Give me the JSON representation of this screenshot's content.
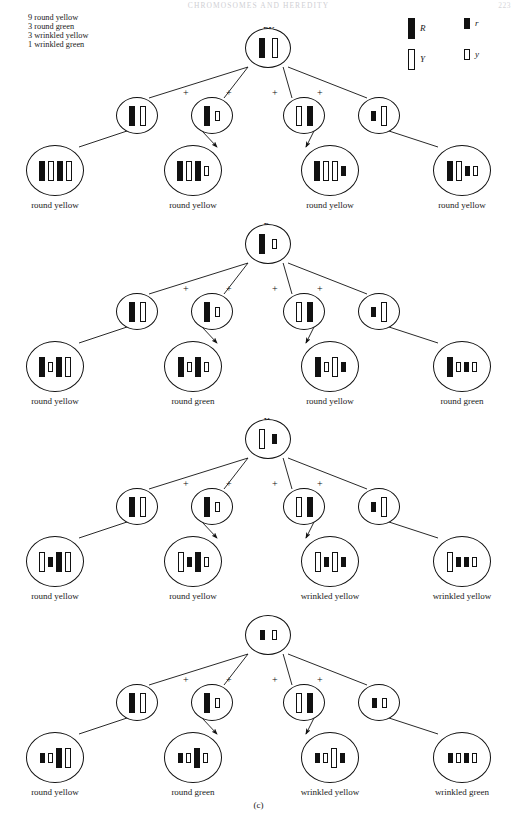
{
  "page": {
    "running_head": "CHROMOSOMES AND HEREDITY",
    "folio": "223",
    "panel_letter": "(c)"
  },
  "ratio_key": {
    "lines": [
      "9 round yellow",
      "3 round green",
      "3 wrinkled yellow",
      "1 wrinkled green"
    ]
  },
  "allele_legend": {
    "items": [
      {
        "symbol": "R",
        "type": "dark",
        "size": "tall",
        "name": "allele-R"
      },
      {
        "symbol": "r",
        "type": "dark",
        "size": "short",
        "name": "allele-r"
      },
      {
        "symbol": "Y",
        "type": "light",
        "size": "tall",
        "name": "allele-Y"
      },
      {
        "symbol": "y",
        "type": "light",
        "size": "short",
        "name": "allele-y"
      }
    ]
  },
  "gamete_types": {
    "labels": [
      "RY",
      "Ry",
      "Yr",
      "ry"
    ],
    "plus_symbol": "+"
  },
  "chart_data": {
    "type": "diagram",
    "phenotype_ratio": {
      "round yellow": 9,
      "round green": 3,
      "wrinkled yellow": 3,
      "wrinkled green": 1
    },
    "rows": [
      {
        "parent_label": "RY",
        "parent_bars": [
          {
            "type": "dark",
            "size": "tall"
          },
          {
            "type": "light",
            "size": "tall"
          }
        ],
        "gametes": [
          {
            "label": "RY",
            "bars": [
              {
                "type": "dark",
                "size": "tall"
              },
              {
                "type": "light",
                "size": "tall"
              }
            ]
          },
          {
            "label": "Ry",
            "bars": [
              {
                "type": "dark",
                "size": "tall"
              },
              {
                "type": "light",
                "size": "short"
              }
            ]
          },
          {
            "label": "Yr",
            "bars": [
              {
                "type": "light",
                "size": "tall"
              },
              {
                "type": "dark",
                "size": "tall"
              }
            ]
          },
          {
            "label": "ry",
            "bars": [
              {
                "type": "dark",
                "size": "short"
              },
              {
                "type": "light",
                "size": "tall"
              }
            ]
          }
        ],
        "offspring": [
          {
            "phenotype": "round yellow",
            "bars": [
              {
                "type": "dark",
                "size": "tall"
              },
              {
                "type": "light",
                "size": "tall"
              },
              {
                "type": "dark",
                "size": "tall"
              },
              {
                "type": "light",
                "size": "tall"
              }
            ]
          },
          {
            "phenotype": "round yellow",
            "bars": [
              {
                "type": "dark",
                "size": "tall"
              },
              {
                "type": "light",
                "size": "tall"
              },
              {
                "type": "dark",
                "size": "tall"
              },
              {
                "type": "light",
                "size": "short"
              }
            ]
          },
          {
            "phenotype": "round yellow",
            "bars": [
              {
                "type": "dark",
                "size": "tall"
              },
              {
                "type": "light",
                "size": "tall"
              },
              {
                "type": "light",
                "size": "tall"
              },
              {
                "type": "dark",
                "size": "short"
              }
            ]
          },
          {
            "phenotype": "round yellow",
            "bars": [
              {
                "type": "dark",
                "size": "tall"
              },
              {
                "type": "light",
                "size": "tall"
              },
              {
                "type": "dark",
                "size": "short"
              },
              {
                "type": "light",
                "size": "short"
              }
            ]
          }
        ]
      },
      {
        "parent_label": "Ry",
        "parent_bars": [
          {
            "type": "dark",
            "size": "tall"
          },
          {
            "type": "light",
            "size": "short"
          }
        ],
        "gametes": [
          {
            "label": "RY",
            "bars": [
              {
                "type": "dark",
                "size": "tall"
              },
              {
                "type": "light",
                "size": "tall"
              }
            ]
          },
          {
            "label": "Ry",
            "bars": [
              {
                "type": "dark",
                "size": "tall"
              },
              {
                "type": "light",
                "size": "short"
              }
            ]
          },
          {
            "label": "Yr",
            "bars": [
              {
                "type": "light",
                "size": "tall"
              },
              {
                "type": "dark",
                "size": "tall"
              }
            ]
          },
          {
            "label": "ry",
            "bars": [
              {
                "type": "dark",
                "size": "short"
              },
              {
                "type": "light",
                "size": "tall"
              }
            ]
          }
        ],
        "offspring": [
          {
            "phenotype": "round yellow",
            "bars": [
              {
                "type": "dark",
                "size": "tall"
              },
              {
                "type": "light",
                "size": "short"
              },
              {
                "type": "dark",
                "size": "tall"
              },
              {
                "type": "light",
                "size": "tall"
              }
            ]
          },
          {
            "phenotype": "round green",
            "bars": [
              {
                "type": "dark",
                "size": "tall"
              },
              {
                "type": "light",
                "size": "short"
              },
              {
                "type": "dark",
                "size": "tall"
              },
              {
                "type": "light",
                "size": "short"
              }
            ]
          },
          {
            "phenotype": "round yellow",
            "bars": [
              {
                "type": "dark",
                "size": "tall"
              },
              {
                "type": "light",
                "size": "short"
              },
              {
                "type": "light",
                "size": "tall"
              },
              {
                "type": "dark",
                "size": "short"
              }
            ]
          },
          {
            "phenotype": "round green",
            "bars": [
              {
                "type": "dark",
                "size": "tall"
              },
              {
                "type": "light",
                "size": "short"
              },
              {
                "type": "dark",
                "size": "short"
              },
              {
                "type": "light",
                "size": "short"
              }
            ]
          }
        ]
      },
      {
        "parent_label": "Yr",
        "parent_bars": [
          {
            "type": "light",
            "size": "tall"
          },
          {
            "type": "dark",
            "size": "short"
          }
        ],
        "gametes": [
          {
            "label": "RY",
            "bars": [
              {
                "type": "dark",
                "size": "tall"
              },
              {
                "type": "light",
                "size": "tall"
              }
            ]
          },
          {
            "label": "Ry",
            "bars": [
              {
                "type": "dark",
                "size": "tall"
              },
              {
                "type": "light",
                "size": "short"
              }
            ]
          },
          {
            "label": "Yr",
            "bars": [
              {
                "type": "light",
                "size": "tall"
              },
              {
                "type": "dark",
                "size": "tall"
              }
            ]
          },
          {
            "label": "ry",
            "bars": [
              {
                "type": "dark",
                "size": "short"
              },
              {
                "type": "light",
                "size": "tall"
              }
            ]
          }
        ],
        "offspring": [
          {
            "phenotype": "round yellow",
            "bars": [
              {
                "type": "light",
                "size": "tall"
              },
              {
                "type": "dark",
                "size": "short"
              },
              {
                "type": "dark",
                "size": "tall"
              },
              {
                "type": "light",
                "size": "tall"
              }
            ]
          },
          {
            "phenotype": "round yellow",
            "bars": [
              {
                "type": "light",
                "size": "tall"
              },
              {
                "type": "dark",
                "size": "short"
              },
              {
                "type": "dark",
                "size": "tall"
              },
              {
                "type": "light",
                "size": "short"
              }
            ]
          },
          {
            "phenotype": "wrinkled yellow",
            "bars": [
              {
                "type": "light",
                "size": "tall"
              },
              {
                "type": "dark",
                "size": "short"
              },
              {
                "type": "light",
                "size": "tall"
              },
              {
                "type": "dark",
                "size": "short"
              }
            ]
          },
          {
            "phenotype": "wrinkled yellow",
            "bars": [
              {
                "type": "light",
                "size": "tall"
              },
              {
                "type": "dark",
                "size": "short"
              },
              {
                "type": "dark",
                "size": "short"
              },
              {
                "type": "light",
                "size": "short"
              }
            ]
          }
        ]
      },
      {
        "parent_label": "ry",
        "parent_bars": [
          {
            "type": "dark",
            "size": "short"
          },
          {
            "type": "light",
            "size": "short"
          }
        ],
        "gametes": [
          {
            "label": "RY",
            "bars": [
              {
                "type": "dark",
                "size": "tall"
              },
              {
                "type": "light",
                "size": "tall"
              }
            ]
          },
          {
            "label": "Ry",
            "bars": [
              {
                "type": "dark",
                "size": "tall"
              },
              {
                "type": "light",
                "size": "short"
              }
            ]
          },
          {
            "label": "Yr",
            "bars": [
              {
                "type": "light",
                "size": "tall"
              },
              {
                "type": "dark",
                "size": "tall"
              }
            ]
          },
          {
            "label": "ry",
            "bars": [
              {
                "type": "dark",
                "size": "short"
              },
              {
                "type": "light",
                "size": "short"
              }
            ]
          }
        ],
        "offspring": [
          {
            "phenotype": "round yellow",
            "bars": [
              {
                "type": "dark",
                "size": "short"
              },
              {
                "type": "light",
                "size": "short"
              },
              {
                "type": "dark",
                "size": "tall"
              },
              {
                "type": "light",
                "size": "tall"
              }
            ]
          },
          {
            "phenotype": "round green",
            "bars": [
              {
                "type": "dark",
                "size": "short"
              },
              {
                "type": "light",
                "size": "short"
              },
              {
                "type": "dark",
                "size": "tall"
              },
              {
                "type": "light",
                "size": "short"
              }
            ]
          },
          {
            "phenotype": "wrinkled yellow",
            "bars": [
              {
                "type": "dark",
                "size": "short"
              },
              {
                "type": "light",
                "size": "short"
              },
              {
                "type": "light",
                "size": "tall"
              },
              {
                "type": "dark",
                "size": "short"
              }
            ]
          },
          {
            "phenotype": "wrinkled green",
            "bars": [
              {
                "type": "dark",
                "size": "short"
              },
              {
                "type": "light",
                "size": "short"
              },
              {
                "type": "dark",
                "size": "short"
              },
              {
                "type": "light",
                "size": "short"
              }
            ]
          }
        ]
      }
    ]
  }
}
